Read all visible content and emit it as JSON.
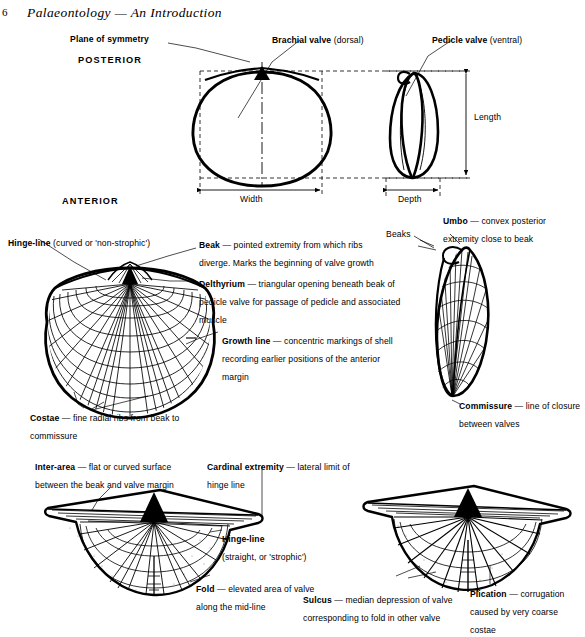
{
  "page": {
    "folio": "6",
    "running_head": "Palaeontology — An Introduction",
    "width": 585,
    "height": 629,
    "ink_color": "#000000",
    "background_color": "#ffffff"
  },
  "figure_top": {
    "caption_plane_of_symmetry": "Plane of symmetry",
    "label_posterior": "POSTERIOR",
    "label_anterior": "ANTERIOR",
    "label_brachial_valve_bold": "Brachial valve",
    "label_brachial_valve_rest": " (dorsal)",
    "label_pedicle_valve_bold": "Pedicle valve",
    "label_pedicle_valve_rest": " (ventral)",
    "dimension_width": "Width",
    "dimension_depth": "Depth",
    "dimension_length": "Length"
  },
  "figure_middle": {
    "hinge_line_bold": "Hinge-line",
    "hinge_line_rest": " (curved or 'non-strophic')",
    "beaks_label": "Beaks",
    "terms": [
      {
        "name": "beak",
        "bold": "Beak",
        "body": " — pointed extremity from which ribs diverge. Marks the beginning of valve growth"
      },
      {
        "name": "delthyrium",
        "bold": "Delthyrium",
        "body": " — triangular opening beneath beak of pedicle valve for passage of pedicle and associated muscle"
      },
      {
        "name": "growth-line",
        "bold": "Growth line",
        "body": " — concentric markings of shell recording earlier positions of the anterior margin"
      },
      {
        "name": "costae",
        "bold": "Costae",
        "body": " — fine radial ribs from beak to commissure"
      },
      {
        "name": "umbo",
        "bold": "Umbo",
        "body": " — convex posterior extremity close to beak"
      },
      {
        "name": "commissure",
        "bold": "Commissure",
        "body": " — line of closure between valves"
      }
    ]
  },
  "figure_bottom": {
    "terms": [
      {
        "name": "inter-area",
        "bold": "Inter-area",
        "body": " — flat or curved surface between the beak and valve margin"
      },
      {
        "name": "cardinal-extremity",
        "bold": "Cardinal extremity",
        "body": " — lateral limit of hinge line"
      },
      {
        "name": "hinge-line",
        "bold": "Hinge-line",
        "body": " (straight, or 'strophic')"
      },
      {
        "name": "fold",
        "bold": "Fold",
        "body": " — elevated area of valve along the mid-line"
      },
      {
        "name": "sulcus",
        "bold": "Sulcus",
        "body": " — median depression of valve corresponding to fold in other valve"
      },
      {
        "name": "plication",
        "bold": "Plication",
        "body": " — corrugation caused by very coarse costae"
      }
    ]
  }
}
